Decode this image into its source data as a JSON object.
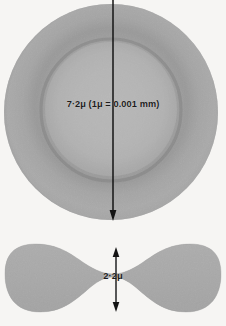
{
  "figure": {
    "background_color": "#f6f5f3",
    "cell_fill_color": "#a9a9a9",
    "cell_rim_color": "#8f8f8f",
    "cell_center_color": "#b6b6b6",
    "annotation_color": "#1d1d1d"
  },
  "top_view": {
    "name": "erythrocyte-top-view",
    "shape": "disc",
    "diameter_label": "7·2μ (1μ = 0.001 mm)",
    "diameter_value": "7.2",
    "diameter_unit": "μ",
    "conversion_note": "1μ = 0.001 mm",
    "arrow": {
      "name": "diameter-arrow",
      "orientation": "vertical",
      "heads": "bottom"
    }
  },
  "cross_section": {
    "name": "erythrocyte-cross-section",
    "shape": "biconcave-disc",
    "thickness_label": "2·2μ",
    "thickness_value": "2.2",
    "thickness_unit": "μ",
    "arrow": {
      "name": "thickness-arrow",
      "orientation": "vertical",
      "heads": "both"
    }
  }
}
